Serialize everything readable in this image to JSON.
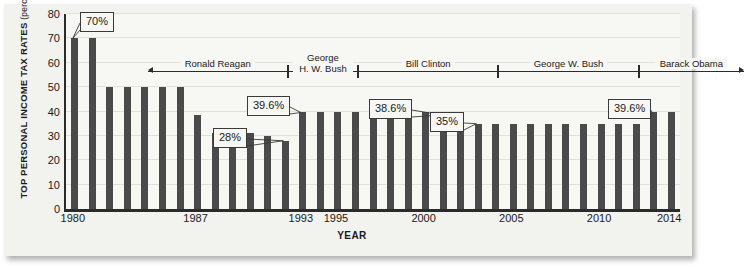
{
  "chart_data": {
    "type": "bar",
    "title": "",
    "xlabel": "YEAR",
    "ylabel": "TOP PERSONAL INCOME TAX RATES",
    "ylabel_unit": "(percent)",
    "ylim": [
      0,
      80
    ],
    "yticks": [
      0,
      10,
      20,
      30,
      40,
      50,
      60,
      70,
      80
    ],
    "xticks": [
      "1980",
      "1987",
      "1993",
      "1995",
      "2000",
      "2005",
      "2010",
      "2014"
    ],
    "grid": true,
    "legend": "none",
    "bar_color": "#4a4a4a",
    "categories": [
      "1980",
      "1981",
      "1982",
      "1983",
      "1984",
      "1985",
      "1986",
      "1987",
      "1988",
      "1989",
      "1990",
      "1991",
      "1992",
      "1993",
      "1994",
      "1995",
      "1996",
      "1997",
      "1998",
      "1999",
      "2000",
      "2001",
      "2002",
      "2003",
      "2004",
      "2005",
      "2006",
      "2007",
      "2008",
      "2009",
      "2010",
      "2011",
      "2012",
      "2013",
      "2014"
    ],
    "values": [
      70,
      70,
      50,
      50,
      50,
      50,
      50,
      38.5,
      31,
      31,
      31,
      30,
      28,
      39.6,
      39.6,
      39.6,
      39.6,
      39.6,
      39.6,
      39.6,
      39.6,
      38.6,
      38.6,
      35,
      35,
      35,
      35,
      35,
      35,
      35,
      35,
      35,
      35,
      39.6,
      39.6
    ],
    "annotations": [
      {
        "label": "70%",
        "year": "1980",
        "value": 70
      },
      {
        "label": "28%",
        "year": "1992",
        "value": 28
      },
      {
        "label": "39.6%",
        "year": "1993",
        "value": 39.6
      },
      {
        "label": "38.6%",
        "year": "2001",
        "value": 38.6
      },
      {
        "label": "35%",
        "year": "2003",
        "value": 35
      },
      {
        "label": "39.6%",
        "year": "2013",
        "value": 39.6
      }
    ],
    "terms": [
      {
        "name": "Ronald Reagan",
        "start": "1981",
        "end": "1988",
        "arrow_left": true,
        "arrow_right": false
      },
      {
        "name": "George H. W. Bush",
        "name_line1": "George",
        "name_line2": "H. W. Bush",
        "start": "1989",
        "end": "1992",
        "arrow_left": false,
        "arrow_right": false
      },
      {
        "name": "Bill Clinton",
        "start": "1993",
        "end": "2000",
        "arrow_left": false,
        "arrow_right": false
      },
      {
        "name": "George W. Bush",
        "start": "2001",
        "end": "2008",
        "arrow_left": false,
        "arrow_right": false
      },
      {
        "name": "Barack Obama",
        "start": "2009",
        "end": "2014",
        "arrow_left": false,
        "arrow_right": true
      }
    ]
  }
}
